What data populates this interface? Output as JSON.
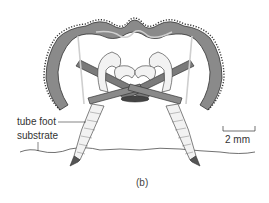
{
  "figure": {
    "panel_label": "(b)",
    "labels": {
      "tube_foot": "tube foot",
      "substrate": "substrate",
      "scale_bar": "2 mm"
    },
    "colors": {
      "test_fill": "#8a8a8a",
      "test_highlight": "#c9c9c9",
      "outline": "#333333",
      "tube_foot_fill": "#f2f2f2",
      "background": "#ffffff"
    }
  }
}
